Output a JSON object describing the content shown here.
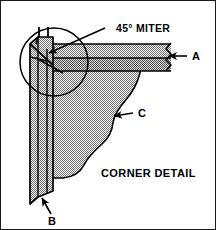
{
  "figure": {
    "title": "CORNER DETAIL",
    "callouts": {
      "miter": "45° MITER",
      "key_a": "A",
      "key_b": "B",
      "key_c": "C"
    },
    "colors": {
      "background": "#ffffff",
      "line": "#000000",
      "border": "#1a1a1a",
      "shade_light": "#d8d8d8",
      "shade_mid": "#c4c4c4",
      "shade_dark": "#ababab"
    },
    "parts": {
      "horizontal_beam": "horizontal-beam",
      "vertical_post": "vertical-post",
      "scalloped_bracket": "scalloped-bracket",
      "detail_circle": "detail-circle",
      "fastener_marks": "fastener-marks",
      "break_line": "break-line"
    }
  }
}
